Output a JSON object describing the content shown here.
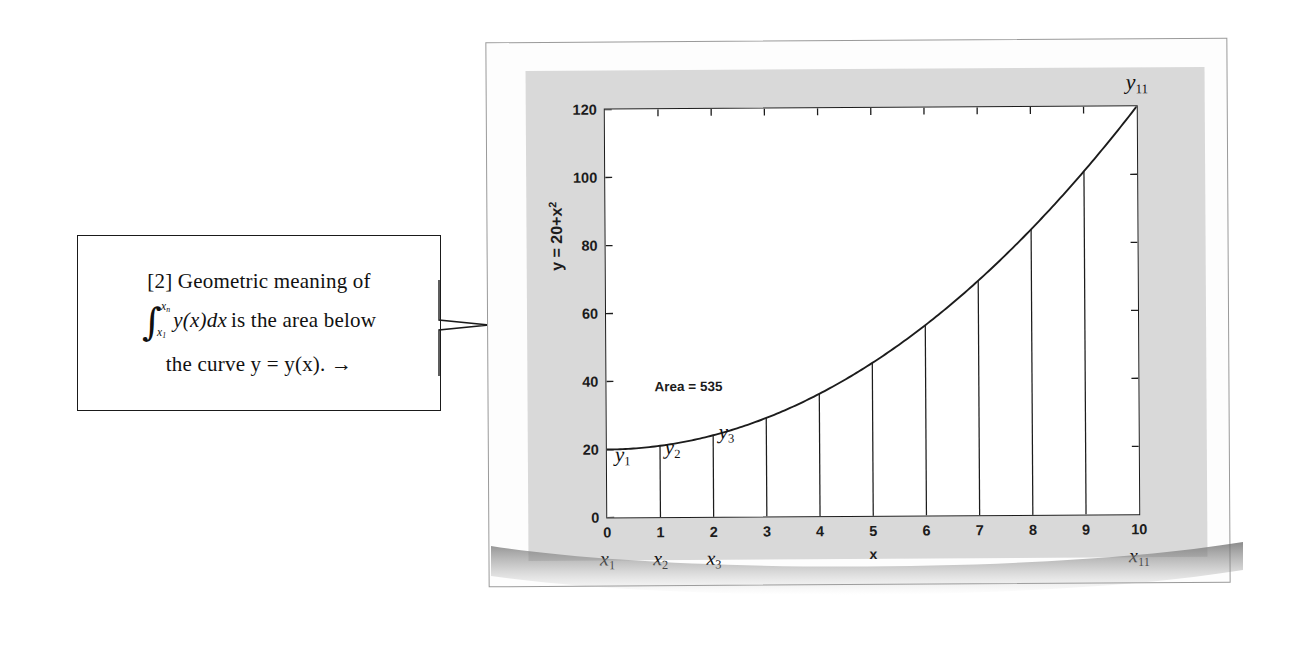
{
  "callout": {
    "prefix": "[2]",
    "line1": "[2] Geometric meaning of",
    "line1_text": "Geometric meaning of",
    "integral_upper": "x",
    "integral_upper_sub": "n",
    "integral_lower": "x",
    "integral_lower_sub": "1",
    "integrand": "y(x)dx",
    "line2_tail": "is the area below",
    "line3": "the curve y = y(x).  →",
    "arrow_glyph": "→"
  },
  "chart_data": {
    "type": "area",
    "title": "",
    "subtitle": "",
    "xlabel": "x",
    "ylabel": "y = 20+x²",
    "ylabel_base": "y = 20+x",
    "ylabel_exp": "2",
    "xlim": [
      0,
      10
    ],
    "ylim": [
      0,
      120
    ],
    "grid": false,
    "legend": false,
    "function": "y = 20 + x^2",
    "x": [
      0,
      1,
      2,
      3,
      4,
      5,
      6,
      7,
      8,
      9,
      10
    ],
    "values": [
      20,
      21,
      24,
      29,
      36,
      45,
      56,
      69,
      84,
      101,
      120
    ],
    "xticks": [
      "0",
      "1",
      "2",
      "3",
      "4",
      "5",
      "6",
      "7",
      "8",
      "9",
      "10"
    ],
    "xtick_values": [
      0,
      1,
      2,
      3,
      4,
      5,
      6,
      7,
      8,
      9,
      10
    ],
    "yticks": [
      "0",
      "20",
      "40",
      "60",
      "80",
      "100",
      "120"
    ],
    "ytick_values": [
      0,
      20,
      40,
      60,
      80,
      100,
      120
    ],
    "annotations": [
      {
        "name": "area-annotation",
        "text": "Area = 535",
        "x": 1.0,
        "y": 40
      },
      {
        "name": "y1-label",
        "text": "y",
        "sub": "1",
        "x": 0.0,
        "y": 20
      },
      {
        "name": "y2-label",
        "text": "y",
        "sub": "2",
        "x": 1.0,
        "y": 21
      },
      {
        "name": "y3-label",
        "text": "y",
        "sub": "3",
        "x": 2.0,
        "y": 24
      },
      {
        "name": "y11-label",
        "text": "y",
        "sub": "11",
        "x": 10.0,
        "y": 120
      }
    ],
    "x_node_labels": [
      {
        "text": "x",
        "sub": "1",
        "x": 0
      },
      {
        "text": "x",
        "sub": "2",
        "x": 1
      },
      {
        "text": "x",
        "sub": "3",
        "x": 2
      },
      {
        "text": "x",
        "sub": "11",
        "x": 10
      }
    ],
    "area_value": 535,
    "area_label": "Area = 535",
    "num_strips": 10,
    "strip_x": [
      1,
      2,
      3,
      4,
      5,
      6,
      7,
      8,
      9
    ],
    "colors": {
      "curve": "#1c1c1c",
      "strip_line": "#1c1c1c",
      "axis": "#1c1c1c",
      "plot_background": "#ffffff",
      "figure_background": "#d9d9d9",
      "card_background": "#fdfdfd",
      "page_background": "#ffffff"
    }
  }
}
